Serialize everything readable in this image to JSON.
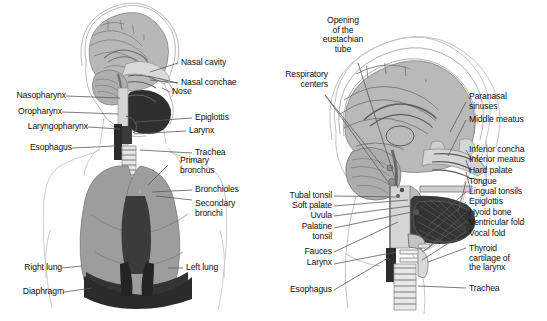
{
  "figure": {
    "background_color": "#ffffff",
    "text_color": "#111111",
    "leader_line_color": "#5a5a5a"
  },
  "palette": {
    "body_outline": "#c8c8c8",
    "skull_outline": "#9e9e9e",
    "brain_fill": "#b4b4b4",
    "brain_line": "#6e6e6e",
    "lung_fill": "#9a9a9a",
    "lung_tree": "#f2f2f2",
    "diaphragm": "#3a3a3a",
    "oral_cavity": "#2e2e2e",
    "airway_fill": "#d8d8d8",
    "tongue_fill": "#3c3c3c",
    "cartilage": "#cfcfcf"
  },
  "panels": [
    {
      "id": "left-panel",
      "name": "head-neck-and-lungs",
      "labels_left": [
        {
          "key": "nasopharynx",
          "text": "Nasopharynx"
        },
        {
          "key": "oropharynx",
          "text": "Oropharynx"
        },
        {
          "key": "laryngopharynx",
          "text": "Laryngopharynx"
        },
        {
          "key": "esophagus",
          "text": "Esophagus"
        },
        {
          "key": "right_lung",
          "text": "Right lung"
        },
        {
          "key": "diaphragm",
          "text": "Diaphragm"
        }
      ],
      "labels_right": [
        {
          "key": "nasal_cavity",
          "text": "Nasal cavity"
        },
        {
          "key": "nasal_conchae",
          "text": "Nasal conchae"
        },
        {
          "key": "nose",
          "text": "Nose"
        },
        {
          "key": "epiglottis",
          "text": "Epiglottis"
        },
        {
          "key": "larynx",
          "text": "Larynx"
        },
        {
          "key": "trachea",
          "text": "Trachea"
        },
        {
          "key": "primary_bronchus",
          "text": "Primary\nbronchus"
        },
        {
          "key": "bronchioles",
          "text": "Bronchioles"
        },
        {
          "key": "secondary_bronchi",
          "text": "Secondary\nbronchi"
        },
        {
          "key": "left_lung",
          "text": "Left lung"
        }
      ]
    },
    {
      "id": "right-panel",
      "name": "head-sagittal-section",
      "labels_top": [
        {
          "key": "eustachian_opening",
          "text": "Opening\nof the\neustachian\ntube"
        },
        {
          "key": "respiratory_centers",
          "text": "Respiratory\ncenters"
        }
      ],
      "labels_left": [
        {
          "key": "tubal_tonsil",
          "text": "Tubal tonsil"
        },
        {
          "key": "soft_palate",
          "text": "Soft palate"
        },
        {
          "key": "uvula",
          "text": "Uvula"
        },
        {
          "key": "palatine_tonsil",
          "text": "Palatine\ntonsil"
        },
        {
          "key": "fauces",
          "text": "Fauces"
        },
        {
          "key": "larynx",
          "text": "Larynx"
        },
        {
          "key": "esophagus",
          "text": "Esophagus"
        }
      ],
      "labels_right": [
        {
          "key": "paranasal_sinuses",
          "text": "Paranasal\nsinuses"
        },
        {
          "key": "middle_meatus",
          "text": "Middle meatus"
        },
        {
          "key": "inferior_concha",
          "text": "Inferior concha"
        },
        {
          "key": "inferior_meatus",
          "text": "Inferior meatus"
        },
        {
          "key": "hard_palate",
          "text": "Hard palate"
        },
        {
          "key": "tongue",
          "text": "Tongue"
        },
        {
          "key": "lingual_tonsils",
          "text": "Lingual tonsils"
        },
        {
          "key": "epiglottis",
          "text": "Epiglottis"
        },
        {
          "key": "hyoid_bone",
          "text": "Hyoid bone"
        },
        {
          "key": "ventricular_fold",
          "text": "Ventricular fold"
        },
        {
          "key": "vocal_fold",
          "text": "Vocal fold"
        },
        {
          "key": "thyroid_cartilage",
          "text": "Thyroid\ncartilage of\nthe larynx"
        },
        {
          "key": "trachea",
          "text": "Trachea"
        }
      ]
    }
  ],
  "caption": {
    "text": ""
  }
}
